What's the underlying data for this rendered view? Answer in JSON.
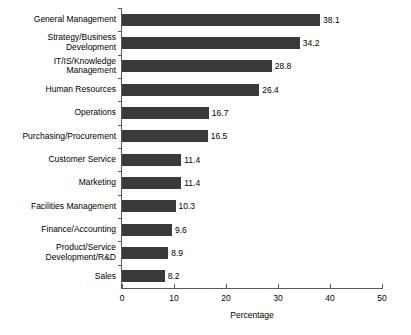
{
  "chart_data": {
    "type": "bar",
    "orientation": "horizontal",
    "title": "",
    "xlabel": "Percentage",
    "ylabel": "",
    "xlim": [
      0,
      50
    ],
    "xticks": [
      0,
      10,
      20,
      30,
      40,
      50
    ],
    "grid": false,
    "legend": false,
    "bar_color": "#3a3a3a",
    "background_color": "#ffffff",
    "axis_color": "#5a5a5a",
    "categories": [
      "General Management",
      "Strategy/Business\nDevelopment",
      "IT/IS/Knowledge\nManagement",
      "Human Resources",
      "Operations",
      "Purchasing/Procurement",
      "Customer Service",
      "Marketing",
      "Facilities Management",
      "Finance/Accounting",
      "Product/Service\nDevelopment/R&D",
      "Sales"
    ],
    "values": [
      38.1,
      34.2,
      28.8,
      26.4,
      16.7,
      16.5,
      11.4,
      11.4,
      10.3,
      9.6,
      8.9,
      8.2
    ],
    "value_labels": [
      "38.1",
      "34.2",
      "28.8",
      "26.4",
      "16.7",
      "16.5",
      "11.4",
      "11.4",
      "10.3",
      "9.6",
      "8.9",
      "8.2"
    ],
    "xtick_labels": [
      "0",
      "10",
      "20",
      "30",
      "40",
      "50"
    ]
  }
}
